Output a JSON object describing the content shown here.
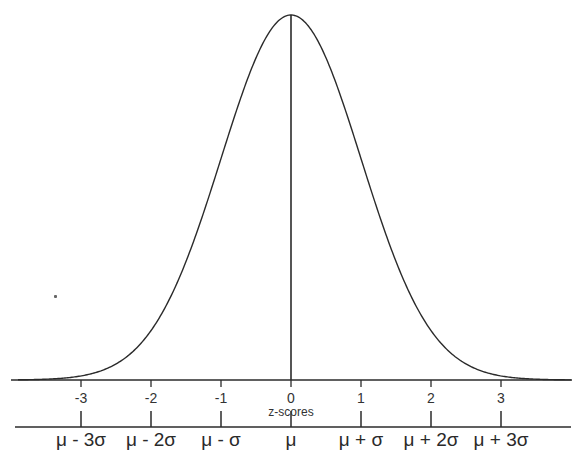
{
  "chart_data": {
    "type": "line",
    "title": "",
    "xlabel": "z-scores",
    "ylabel": "",
    "x_ticks": [
      -3,
      -2,
      -1,
      0,
      1,
      2,
      3
    ],
    "x_tick_labels": [
      "-3",
      "-2",
      "-1",
      "0",
      "1",
      "2",
      "3"
    ],
    "secondary_axis_labels": [
      "μ - 3σ",
      "μ - 2σ",
      "μ - σ",
      "μ",
      "μ + σ",
      "μ + 2σ",
      "μ + 3σ"
    ],
    "xlim": [
      -3.9,
      4.0
    ],
    "series": [
      {
        "name": "normal density",
        "function": "exp(-z^2/2)/sqrt(2π)",
        "x": [
          -3.5,
          -3,
          -2.5,
          -2,
          -1.5,
          -1,
          -0.5,
          0,
          0.5,
          1,
          1.5,
          2,
          2.5,
          3,
          3.5
        ],
        "y": [
          0.0009,
          0.0044,
          0.0175,
          0.054,
          0.1295,
          0.242,
          0.3521,
          0.3989,
          0.3521,
          0.242,
          0.1295,
          0.054,
          0.0175,
          0.0044,
          0.0009
        ]
      }
    ],
    "annotations": [
      "vertical line at z = 0 (mean)"
    ],
    "grid": false,
    "legend": "none"
  },
  "axis": {
    "z_title": "z-scores",
    "z_ticks": [
      "-3",
      "-2",
      "-1",
      "0",
      "1",
      "2",
      "3"
    ],
    "sigma_ticks": [
      "μ - 3σ",
      "μ - 2σ",
      "μ - σ",
      "μ",
      "μ + σ",
      "μ + 2σ",
      "μ + 3σ"
    ]
  },
  "colors": {
    "line": "#2b2b2b",
    "text": "#333333",
    "background": "#ffffff"
  }
}
